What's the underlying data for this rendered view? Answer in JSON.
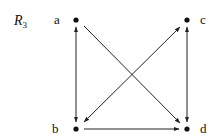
{
  "diagram": {
    "title": "R",
    "title_subscript": "3",
    "colors": {
      "ink": "#111111",
      "edge": "#222222",
      "background": "#ffffff"
    },
    "nodes": [
      {
        "id": "a",
        "label": "a",
        "x": 76,
        "y": 20
      },
      {
        "id": "b",
        "label": "b",
        "x": 76,
        "y": 129
      },
      {
        "id": "c",
        "label": "c",
        "x": 187,
        "y": 20
      },
      {
        "id": "d",
        "label": "d",
        "x": 187,
        "y": 129
      }
    ],
    "edges": [
      {
        "from": "a",
        "to": "b",
        "bidirectional": true
      },
      {
        "from": "c",
        "to": "d",
        "bidirectional": true
      },
      {
        "from": "a",
        "to": "d",
        "bidirectional": false
      },
      {
        "from": "b",
        "to": "c",
        "bidirectional": true
      },
      {
        "from": "b",
        "to": "d",
        "bidirectional": false
      }
    ]
  }
}
